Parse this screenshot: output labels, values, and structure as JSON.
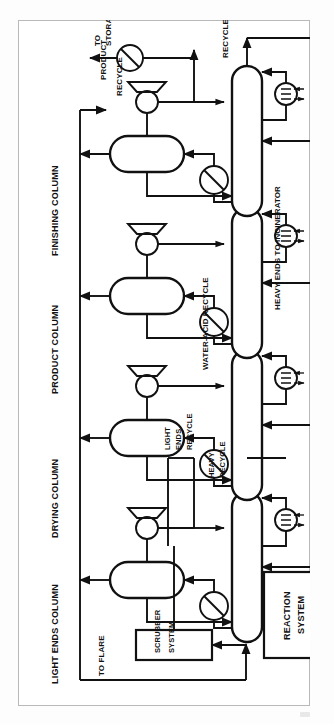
{
  "figure": {
    "kind": "process-flow-diagram",
    "orientation": "rotated-90-ccw",
    "page_background": "#ffffff",
    "line_color": "#111111",
    "frame_color": "#b9b9b9"
  },
  "column_titles": [
    {
      "id": "light-ends-column",
      "label": "LIGHT ENDS COLUMN"
    },
    {
      "id": "drying-column",
      "label": "DRYING COLUMN"
    },
    {
      "id": "product-column",
      "label": "PRODUCT COLUMN"
    },
    {
      "id": "finishing-column",
      "label": "FINISHING COLUMN"
    }
  ],
  "units": [
    {
      "id": "reaction-system",
      "label_line1": "REACTION",
      "label_line2": "SYSTEM"
    },
    {
      "id": "scrubber-system",
      "label_line1": "SCRUBBER",
      "label_line2": "SYSTEM"
    }
  ],
  "feeds": [
    {
      "id": "co-feed",
      "label": "CO"
    },
    {
      "id": "meoh-feed",
      "label": "MeOH"
    }
  ],
  "streams": [
    {
      "id": "to-flare",
      "label": "TO FLARE"
    },
    {
      "id": "heavy-recycle",
      "line1": "HEAVY",
      "line2": "RECYCLE"
    },
    {
      "id": "light-ends-recycle",
      "line1": "LIGHT",
      "line2": "ENDS",
      "line3": "RECYCLE"
    },
    {
      "id": "water-acid-recycle",
      "label": "WATER-ACID RECYCLE"
    },
    {
      "id": "heavy-ends-to-incinerator",
      "label": "HEAVY ENDS TO INCINERATOR"
    },
    {
      "id": "recycle-bottom",
      "label": "RECYCLE"
    },
    {
      "id": "recycle-overhead",
      "label": "RECYCLE"
    },
    {
      "id": "product",
      "label": "PRODUCT"
    },
    {
      "id": "to-storage",
      "line1": "TO",
      "line2": "STORAGE"
    }
  ],
  "equipment_symbols": [
    {
      "id": "condenser",
      "glyph": "circle-with-diagonal",
      "count": 4
    },
    {
      "id": "reflux-drum",
      "glyph": "vertical-capsule",
      "count": 4
    },
    {
      "id": "reflux-pump",
      "glyph": "centrifugal-pump",
      "count": 4
    },
    {
      "id": "reboiler",
      "glyph": "circle-with-element",
      "count": 4
    },
    {
      "id": "distillation-column",
      "glyph": "horizontal-capsule",
      "count": 4
    },
    {
      "id": "feed-compressor",
      "glyph": "circle-driver",
      "count": 2
    }
  ]
}
